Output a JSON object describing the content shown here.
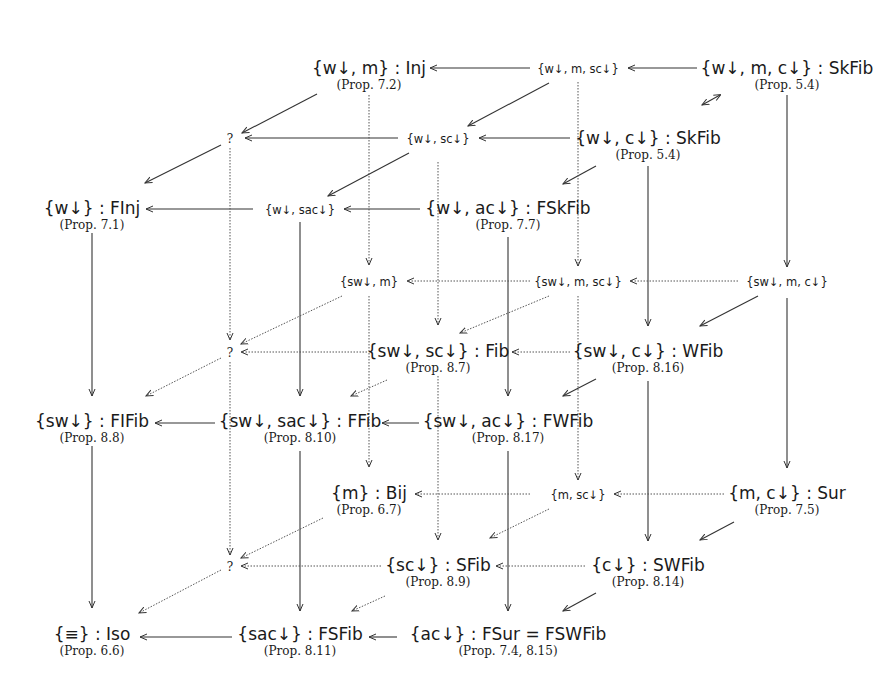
{
  "nodes": {
    "wm": {
      "label": "{w↓, m} : Inj",
      "prop": "(Prop. 7.2)"
    },
    "wmsc": {
      "label": "{w↓, m, sc↓}"
    },
    "wmc": {
      "label": "{w↓, m, c↓} : SkFib",
      "prop": "(Prop. 5.4)"
    },
    "q1": {
      "label": "?"
    },
    "wsc": {
      "label": "{w↓, sc↓}"
    },
    "wc": {
      "label": "{w↓, c↓} : SkFib",
      "prop": "(Prop. 5.4)"
    },
    "w": {
      "label": "{w↓} : FInj",
      "prop": "(Prop. 7.1)"
    },
    "wsac": {
      "label": "{w↓, sac↓}"
    },
    "wac": {
      "label": "{w↓, ac↓} : FSkFib",
      "prop": "(Prop. 7.7)"
    },
    "swm": {
      "label": "{sw↓, m}"
    },
    "swmsc": {
      "label": "{sw↓, m, sc↓}"
    },
    "swmc": {
      "label": "{sw↓, m, c↓}"
    },
    "q2": {
      "label": "?"
    },
    "swsc": {
      "label": "{sw↓, sc↓} : Fib",
      "prop": "(Prop. 8.7)"
    },
    "swc": {
      "label": "{sw↓, c↓} : WFib",
      "prop": "(Prop. 8.16)"
    },
    "sw": {
      "label": "{sw↓} : FIFib",
      "prop": "(Prop. 8.8)"
    },
    "swsac": {
      "label": "{sw↓, sac↓} : FFib",
      "prop": "(Prop. 8.10)"
    },
    "swac": {
      "label": "{sw↓, ac↓} : FWFib",
      "prop": "(Prop. 8.17)"
    },
    "m": {
      "label": "{m} : Bij",
      "prop": "(Prop. 6.7)"
    },
    "msc": {
      "label": "{m, sc↓}"
    },
    "mc": {
      "label": "{m, c↓} : Sur",
      "prop": "(Prop. 7.5)"
    },
    "q3": {
      "label": "?"
    },
    "sc": {
      "label": "{sc↓} : SFib",
      "prop": "(Prop. 8.9)"
    },
    "c": {
      "label": "{c↓} : SWFib",
      "prop": "(Prop. 8.14)"
    },
    "eq": {
      "label": "{≡} : Iso",
      "prop": "(Prop. 6.6)"
    },
    "sac": {
      "label": "{sac↓} : FSFib",
      "prop": "(Prop. 8.11)"
    },
    "ac": {
      "label": "{ac↓} : FSur = FSWFib",
      "prop": "(Prop. 7.4, 8.15)"
    }
  }
}
